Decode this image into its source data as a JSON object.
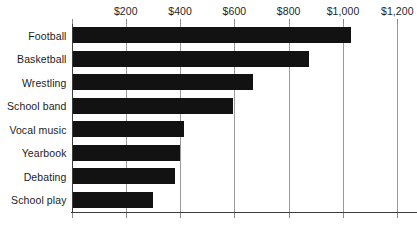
{
  "chart_data": {
    "type": "bar",
    "orientation": "horizontal",
    "title": "",
    "xlabel": "",
    "ylabel": "",
    "categories": [
      "Football",
      "Basketball",
      "Wrestling",
      "School band",
      "Vocal music",
      "Yearbook",
      "Debating",
      "School play"
    ],
    "values": [
      1030,
      875,
      670,
      595,
      415,
      400,
      380,
      300
    ],
    "xlim": [
      0,
      1200
    ],
    "xticks": [
      0,
      200,
      400,
      600,
      800,
      1000,
      1200
    ],
    "xticklabels": [
      "",
      "$200",
      "$400",
      "$600",
      "$800",
      "$1,000",
      "$1,200"
    ],
    "grid": true,
    "legend": false,
    "bar_color": "#121212",
    "gridline_color": "#9a9a9a",
    "axis_color": "#3d3d3d",
    "background": "#ffffff"
  },
  "axis": {
    "tick_labels": [
      {
        "value": 200,
        "text": "$200"
      },
      {
        "value": 400,
        "text": "$400"
      },
      {
        "value": 600,
        "text": "$600"
      },
      {
        "value": 800,
        "text": "$800"
      },
      {
        "value": 1000,
        "text": "$1,000"
      },
      {
        "value": 1200,
        "text": "$1,200"
      }
    ]
  },
  "bars": [
    {
      "label": "Football",
      "value": 1030
    },
    {
      "label": "Basketball",
      "value": 875
    },
    {
      "label": "Wrestling",
      "value": 670
    },
    {
      "label": "School band",
      "value": 595
    },
    {
      "label": "Vocal music",
      "value": 415
    },
    {
      "label": "Yearbook",
      "value": 400
    },
    {
      "label": "Debating",
      "value": 380
    },
    {
      "label": "School play",
      "value": 300
    }
  ],
  "clipped_title": ""
}
